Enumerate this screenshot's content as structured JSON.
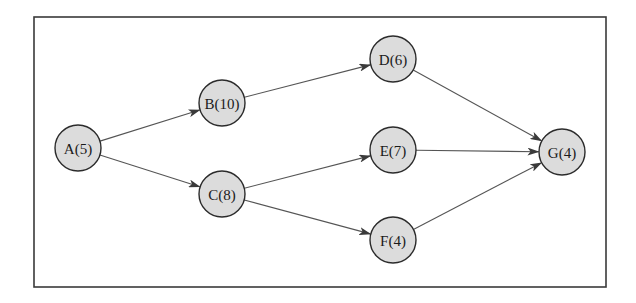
{
  "diagram": {
    "type": "directed-graph",
    "frame": {
      "x": 34,
      "y": 17,
      "width": 572,
      "height": 270
    },
    "style": {
      "node_fill": "#dcdcdc",
      "node_stroke": "#2b2b2b",
      "edge_color": "#555555",
      "frame_color": "#3a3a3a",
      "node_radius": 23
    },
    "nodes": [
      {
        "id": "A",
        "label": "A(5)",
        "name": "A",
        "duration": 5,
        "cx": 78,
        "cy": 148
      },
      {
        "id": "B",
        "label": "B(10)",
        "name": "B",
        "duration": 10,
        "cx": 222,
        "cy": 103
      },
      {
        "id": "C",
        "label": "C(8)",
        "name": "C",
        "duration": 8,
        "cx": 222,
        "cy": 194
      },
      {
        "id": "D",
        "label": "D(6)",
        "name": "D",
        "duration": 6,
        "cx": 393,
        "cy": 59
      },
      {
        "id": "E",
        "label": "E(7)",
        "name": "E",
        "duration": 7,
        "cx": 393,
        "cy": 150
      },
      {
        "id": "F",
        "label": "F(4)",
        "name": "F",
        "duration": 4,
        "cx": 393,
        "cy": 240
      },
      {
        "id": "G",
        "label": "G(4)",
        "name": "G",
        "duration": 4,
        "cx": 562,
        "cy": 152
      }
    ],
    "edges": [
      {
        "from": "A",
        "to": "B"
      },
      {
        "from": "A",
        "to": "C"
      },
      {
        "from": "B",
        "to": "D"
      },
      {
        "from": "C",
        "to": "E"
      },
      {
        "from": "C",
        "to": "F"
      },
      {
        "from": "D",
        "to": "G"
      },
      {
        "from": "E",
        "to": "G"
      },
      {
        "from": "F",
        "to": "G"
      }
    ]
  }
}
